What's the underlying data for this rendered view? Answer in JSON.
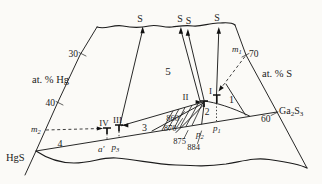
{
  "figure": {
    "sulfur_vertex_labels": [
      "S",
      "S",
      "S",
      "S"
    ],
    "axes": {
      "hg": {
        "title": "at. % Hg",
        "ticks": [
          "30",
          "40"
        ]
      },
      "s": {
        "title": "at. % S",
        "ticks": [
          "70",
          "60"
        ]
      }
    },
    "endmembers": {
      "hgs": "HgS",
      "ga2s3": {
        "el1": "Ga",
        "n1": "2",
        "el2": "S",
        "n2": "3"
      }
    },
    "region_labels": [
      "1",
      "2",
      "3",
      "4",
      "5"
    ],
    "phase_labels": [
      "I",
      "II",
      "III",
      "IV"
    ],
    "temperature_labels": [
      "860",
      "870",
      "875",
      "884"
    ],
    "point_labels": {
      "m1": {
        "base": "m",
        "sub": "1"
      },
      "m2": {
        "base": "m",
        "sub": "2"
      },
      "p1": {
        "base": "p",
        "sub": "1"
      },
      "p2": {
        "base": "p",
        "sub": "2"
      },
      "p3": {
        "base": "p",
        "sub": "3"
      },
      "a_prime": "a′"
    },
    "colors": {
      "ink": "#1c1c1c",
      "paper": "#fbfaf7"
    }
  }
}
